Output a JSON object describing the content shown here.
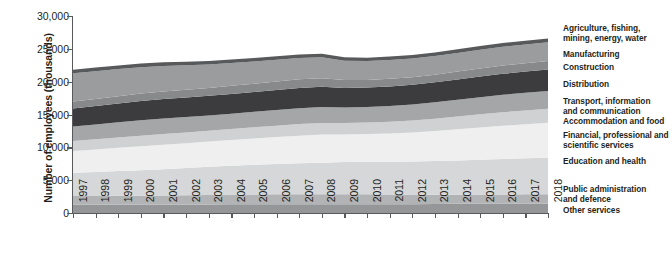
{
  "chart_data": {
    "type": "area",
    "stacked": true,
    "title": "",
    "xlabel": "",
    "ylabel": "Number of employees (thousands)",
    "ylim": [
      0,
      30000
    ],
    "yticks": [
      0,
      5000,
      10000,
      15000,
      20000,
      25000,
      30000
    ],
    "ytick_labels": [
      "0",
      "5,000",
      "10,000",
      "15,000",
      "20,000",
      "25,000",
      "30,000"
    ],
    "grid": false,
    "legend_position": "right",
    "x": [
      1997,
      1998,
      1999,
      2000,
      2001,
      2002,
      2003,
      2004,
      2005,
      2006,
      2007,
      2008,
      2009,
      2010,
      2011,
      2012,
      2013,
      2014,
      2015,
      2016,
      2017,
      2018
    ],
    "xtick_labels": [
      "1997",
      "1998",
      "1999",
      "2000",
      "2001",
      "2002",
      "2003",
      "2004",
      "2005",
      "2006",
      "2007",
      "2008",
      "2009",
      "2010",
      "2011",
      "2012",
      "2013",
      "2014",
      "2015",
      "2016",
      "2017",
      "2018"
    ],
    "stack_order_bottom_to_top": [
      "Other services",
      "Public administration and defence",
      "Education and health",
      "Financial, professional and scientific services",
      "Accommodation and food",
      "Transport, information and communication",
      "Distribution",
      "Construction",
      "Manufacturing",
      "Agriculture, fishing, mining, energy, water"
    ],
    "series": [
      {
        "name": "Other services",
        "color": "#949698",
        "values": [
          1250,
          1260,
          1270,
          1280,
          1290,
          1300,
          1310,
          1320,
          1330,
          1340,
          1350,
          1350,
          1330,
          1330,
          1340,
          1350,
          1370,
          1390,
          1410,
          1430,
          1450,
          1460
        ]
      },
      {
        "name": "Public administration and defence",
        "color": "#b1b3b5",
        "values": [
          1340,
          1345,
          1350,
          1360,
          1380,
          1410,
          1450,
          1480,
          1500,
          1510,
          1510,
          1520,
          1540,
          1530,
          1490,
          1450,
          1420,
          1400,
          1390,
          1390,
          1400,
          1410
        ]
      },
      {
        "name": "Education and health",
        "color": "#d5d7d8",
        "values": [
          3550,
          3640,
          3760,
          3880,
          4000,
          4130,
          4280,
          4410,
          4520,
          4620,
          4700,
          4790,
          4900,
          4960,
          4990,
          5040,
          5110,
          5200,
          5300,
          5400,
          5480,
          5560
        ]
      },
      {
        "name": "Financial, professional and scientific services",
        "color": "#efefef",
        "values": [
          3300,
          3420,
          3540,
          3650,
          3720,
          3780,
          3830,
          3900,
          3990,
          4100,
          4220,
          4290,
          4200,
          4210,
          4300,
          4420,
          4580,
          4760,
          4930,
          5070,
          5190,
          5300
        ]
      },
      {
        "name": "Accommodation and food",
        "color": "#cfd1d2",
        "values": [
          1530,
          1560,
          1590,
          1610,
          1630,
          1640,
          1650,
          1670,
          1700,
          1730,
          1760,
          1770,
          1730,
          1740,
          1780,
          1830,
          1890,
          1950,
          2010,
          2060,
          2100,
          2130
        ]
      },
      {
        "name": "Transport, information and communication",
        "color": "#a4a6a8",
        "values": [
          2200,
          2250,
          2300,
          2350,
          2370,
          2360,
          2340,
          2340,
          2360,
          2390,
          2420,
          2430,
          2370,
          2360,
          2390,
          2430,
          2480,
          2540,
          2600,
          2650,
          2690,
          2730
        ]
      },
      {
        "name": "Distribution",
        "color": "#3c3c3e",
        "values": [
          2750,
          2810,
          2870,
          2930,
          2960,
          2970,
          2980,
          3000,
          3020,
          3040,
          3070,
          3060,
          2980,
          2970,
          2990,
          3010,
          3050,
          3100,
          3150,
          3190,
          3220,
          3250
        ]
      },
      {
        "name": "Construction",
        "color": "#87898b",
        "values": [
          1050,
          1080,
          1110,
          1140,
          1170,
          1190,
          1210,
          1240,
          1270,
          1300,
          1330,
          1310,
          1200,
          1160,
          1150,
          1140,
          1160,
          1190,
          1230,
          1260,
          1280,
          1300
        ]
      },
      {
        "name": "Manufacturing",
        "color": "#9a9c9e",
        "values": [
          4300,
          4230,
          4120,
          4010,
          3880,
          3720,
          3580,
          3480,
          3390,
          3320,
          3260,
          3200,
          2940,
          2870,
          2860,
          2840,
          2830,
          2840,
          2850,
          2850,
          2860,
          2870
        ]
      },
      {
        "name": "Agriculture, fishing, mining, energy, water",
        "color": "#58595b",
        "values": [
          560,
          555,
          550,
          545,
          540,
          535,
          530,
          530,
          530,
          530,
          535,
          540,
          530,
          525,
          530,
          535,
          545,
          555,
          565,
          570,
          575,
          580
        ]
      }
    ],
    "legend_entries": [
      {
        "label": "Agriculture, fishing,\nmining, energy, water",
        "color": "#58595b"
      },
      {
        "label": "Manufacturing",
        "color": "#9a9c9e"
      },
      {
        "label": "Construction",
        "color": "#87898b"
      },
      {
        "label": "Distribution",
        "color": "#3c3c3e"
      },
      {
        "label": "Transport, information\nand communication",
        "color": "#a4a6a8"
      },
      {
        "label": "Accommodation and food",
        "color": "#cfd1d2"
      },
      {
        "label": "Financial, professional and\nscientific services",
        "color": "#efefef"
      },
      {
        "label": "Education and health",
        "color": "#d5d7d8"
      },
      {
        "label": "Public administration\nand defence",
        "color": "#b1b3b5"
      },
      {
        "label": "Other services",
        "color": "#949698"
      }
    ]
  },
  "axis": {
    "ylabel": "Number of employees (thousands)"
  },
  "legend": {
    "items": [
      {
        "text": "Agriculture, fishing, mining, energy, water",
        "line1": "Agriculture, fishing,",
        "line2": "mining, energy, water",
        "top": 24
      },
      {
        "text": "Manufacturing",
        "line1": "Manufacturing",
        "line2": "",
        "top": 50
      },
      {
        "text": "Construction",
        "line1": "Construction",
        "line2": "",
        "top": 63
      },
      {
        "text": "Distribution",
        "line1": "Distribution",
        "line2": "",
        "top": 80
      },
      {
        "text": "Transport, information and communication",
        "line1": "Transport, information",
        "line2": "and communication",
        "top": 97
      },
      {
        "text": "Accommodation and food",
        "line1": "Accommodation and food",
        "line2": "",
        "top": 117
      },
      {
        "text": "Financial, professional and scientific services",
        "line1": "Financial, professional and",
        "line2": "scientific services",
        "top": 131
      },
      {
        "text": "Education and health",
        "line1": "Education and health",
        "line2": "",
        "top": 157
      },
      {
        "text": "Public administration and defence",
        "line1": "Public administration",
        "line2": "and defence",
        "top": 185
      },
      {
        "text": "Other services",
        "line1": "Other services",
        "line2": "",
        "top": 206
      }
    ]
  }
}
